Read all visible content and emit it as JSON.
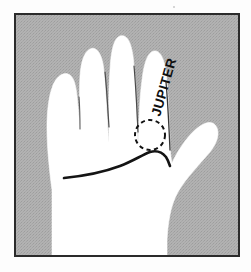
{
  "figure": {
    "caption_text": "JUPITER",
    "label_rotation_deg": -74,
    "marker": "dashed-circle",
    "marker_meaning": "mount marked at base of finger",
    "line_name": "heart-line",
    "page_background": "#fdfdfd",
    "frame_border_color": "#2b2b2b",
    "panel_background": "#adadad",
    "hand_fill": "#ffffff",
    "ink_color": "#161616",
    "crease_color": "#5a5a5a",
    "frame": {
      "x": 14,
      "y": 13,
      "width": 226,
      "height": 244
    },
    "dashed_circle": {
      "cx": 150,
      "cy": 135,
      "r": 15
    }
  }
}
